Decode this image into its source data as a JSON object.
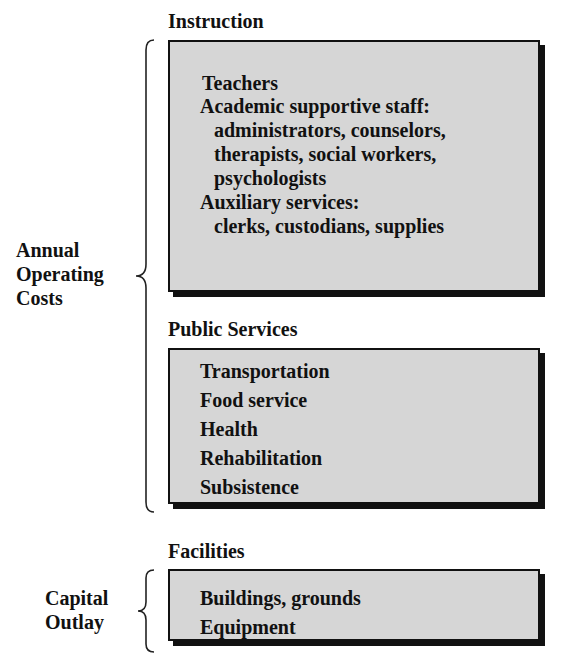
{
  "diagram": {
    "groups": [
      {
        "label_lines": [
          "Annual",
          "Operating",
          "Costs"
        ],
        "covers": [
          "Instruction",
          "Public Services"
        ]
      },
      {
        "label_lines": [
          "Capital",
          "Outlay"
        ],
        "covers": [
          "Facilities"
        ]
      }
    ],
    "sections": [
      {
        "title": "Instruction",
        "items": [
          "Teachers",
          "Academic supportive staff:",
          "  administrators, counselors,",
          "  therapists, social workers,",
          "  psychologists",
          "Auxiliary services:",
          "  clerks, custodians, supplies"
        ]
      },
      {
        "title": "Public Services",
        "items": [
          "Transportation",
          "Food service",
          "Health",
          "Rehabilitation",
          "Subsistence"
        ]
      },
      {
        "title": "Facilities",
        "items": [
          "Buildings, grounds",
          "Equipment"
        ]
      }
    ]
  }
}
